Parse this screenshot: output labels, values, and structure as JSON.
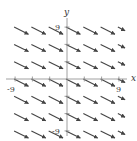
{
  "chart_data": {
    "type": "vector_field",
    "title": "",
    "xlabel": "x",
    "ylabel": "y",
    "xlim": [
      -9,
      9
    ],
    "ylim": [
      -9,
      9
    ],
    "grid": false,
    "tick_step": 3,
    "tick_labels": {
      "x": [
        "-9",
        "9"
      ],
      "y": [
        "9",
        "-9"
      ]
    },
    "sample_points": {
      "x": [
        -9,
        -6,
        -3,
        0,
        3,
        6,
        9
      ],
      "y": [
        9,
        6,
        3,
        0,
        -3,
        -6,
        -9
      ]
    },
    "vector": {
      "dx": 1,
      "dy": -0.5,
      "description": "constant field, all arrows point down-right"
    }
  },
  "axes": {
    "x_label": "x",
    "y_label": "y",
    "x_min_label": "-9",
    "x_max_label": "9",
    "y_max_label": "9",
    "y_min_label": "-9"
  },
  "colors": {
    "axis": "#888888",
    "arrow": "#444444",
    "text": "#333333"
  }
}
